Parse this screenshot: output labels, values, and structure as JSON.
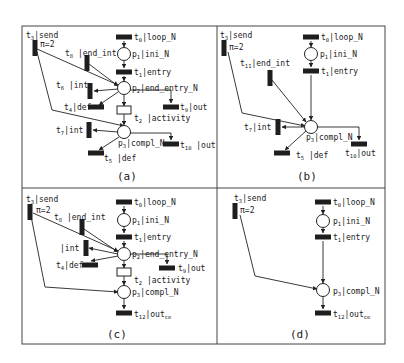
{
  "figure": {
    "frame": {
      "x": 22,
      "y": 26,
      "w": 363,
      "h": 318,
      "vx": 217,
      "hy": 188,
      "color": "#444444"
    },
    "panels": [
      {
        "id": "a",
        "caption": "(a)",
        "caption_pos": [
          117,
          180
        ],
        "places": [
          {
            "id": "p1",
            "x": 124,
            "y": 54,
            "label": "p",
            "sub": "1",
            "rest": "|ini_N",
            "lx": 132,
            "ly": 57
          },
          {
            "id": "p2",
            "x": 124,
            "y": 88,
            "label": "p",
            "sub": "2",
            "rest": "|end_entry_N",
            "lx": 132,
            "ly": 91
          },
          {
            "id": "p3",
            "x": 124,
            "y": 132,
            "label": "p",
            "sub": "3",
            "rest": "|compl_N",
            "lx": 118,
            "ly": 146
          }
        ],
        "transitions": [
          {
            "id": "t0",
            "x": 124,
            "y": 37,
            "orient": "h",
            "label": "t",
            "sub": "0",
            "rest": "|loop_N",
            "lx": 134,
            "ly": 40
          },
          {
            "id": "t1",
            "x": 124,
            "y": 72,
            "orient": "h",
            "label": "t",
            "sub": "1",
            "rest": "|entry",
            "lx": 134,
            "ly": 75
          },
          {
            "id": "t2",
            "x": 124,
            "y": 110,
            "orient": "open",
            "label": "t",
            "sub": "2",
            "rest": " |activity",
            "lx": 134,
            "ly": 121
          },
          {
            "id": "t3",
            "x": 35,
            "y": 48,
            "orient": "v",
            "label": "t",
            "sub": "3",
            "rest": "|send",
            "lx": 26,
            "ly": 38,
            "note": "π=2",
            "nx": 40,
            "ny": 47
          },
          {
            "id": "t8",
            "x": 87,
            "y": 63,
            "orient": "v",
            "label": "t",
            "sub": "8",
            "rest": " |end_int",
            "lx": 65,
            "ly": 56
          },
          {
            "id": "t6",
            "x": 90,
            "y": 91,
            "orient": "v",
            "label": "t",
            "sub": "6",
            "rest": " |int",
            "lx": 56,
            "ly": 88
          },
          {
            "id": "t4",
            "x": 96,
            "y": 107,
            "orient": "h",
            "label": "t",
            "sub": "4",
            "rest": "|def",
            "lx": 64,
            "ly": 110
          },
          {
            "id": "t9",
            "x": 171,
            "y": 107,
            "orient": "h",
            "label": "t",
            "sub": "9",
            "rest": "|out",
            "lx": 180,
            "ly": 110
          },
          {
            "id": "t7",
            "x": 89,
            "y": 130,
            "orient": "v",
            "label": "t",
            "sub": "7",
            "rest": "|int",
            "lx": 56,
            "ly": 133
          },
          {
            "id": "t10",
            "x": 171,
            "y": 144,
            "orient": "h",
            "label": "t",
            "sub": "10",
            "rest": " |out",
            "lx": 180,
            "ly": 148
          },
          {
            "id": "t5",
            "x": 96,
            "y": 153,
            "orient": "h",
            "label": "t",
            "sub": "5",
            "rest": " |def",
            "lx": 104,
            "ly": 161
          }
        ],
        "arcs": [
          "124,41 124,47",
          "124,61 124,68",
          "124,76 124,81",
          "124,95 124,106",
          "124,114 124,125",
          "37,49 118,85",
          "89,64 118,86",
          "118,89 94,91",
          "118,92 99,105",
          "130,90 171,90 171,103",
          "37,52 52,110 124,126",
          "118,132 93,130",
          "130,133 171,133 171,140",
          "119,137 99,150"
        ]
      },
      {
        "id": "b",
        "caption": "(b)",
        "caption_pos": [
          297,
          180
        ],
        "places": [
          {
            "id": "p1",
            "x": 311,
            "y": 54,
            "label": "p",
            "sub": "1",
            "rest": "|ini_N",
            "lx": 320,
            "ly": 57
          },
          {
            "id": "p3",
            "x": 311,
            "y": 127,
            "label": "p",
            "sub": "3",
            "rest": "|compl_N",
            "lx": 306,
            "ly": 140
          }
        ],
        "transitions": [
          {
            "id": "t0",
            "x": 311,
            "y": 37,
            "orient": "h",
            "label": "t",
            "sub": "0",
            "rest": "|loop_N",
            "lx": 321,
            "ly": 40
          },
          {
            "id": "t1",
            "x": 311,
            "y": 71,
            "orient": "h",
            "label": "t",
            "sub": "1",
            "rest": "|entry",
            "lx": 321,
            "ly": 74
          },
          {
            "id": "t3",
            "x": 224,
            "y": 48,
            "orient": "v",
            "label": "t",
            "sub": "3",
            "rest": "|send",
            "lx": 220,
            "ly": 38,
            "note": "π=2",
            "nx": 229,
            "ny": 50
          },
          {
            "id": "t11",
            "x": 270,
            "y": 78,
            "orient": "v",
            "label": "t",
            "sub": "11",
            "rest": "|end_int",
            "lx": 240,
            "ly": 66
          },
          {
            "id": "t7",
            "x": 278,
            "y": 127,
            "orient": "v",
            "label": "t",
            "sub": "7",
            "rest": "|int",
            "lx": 244,
            "ly": 130
          },
          {
            "id": "t10",
            "x": 359,
            "y": 144,
            "orient": "h",
            "label": "t",
            "sub": "10",
            "rest": "|out",
            "lx": 345,
            "ly": 156
          },
          {
            "id": "t5",
            "x": 282,
            "y": 153,
            "orient": "h",
            "label": "t",
            "sub": "5",
            "rest": " |def",
            "lx": 296,
            "ly": 158
          }
        ],
        "arcs": [
          "311,41 311,47",
          "311,61 311,67",
          "311,75 311,120",
          "228,52 242,113 305,126",
          "272,80 306,122",
          "305,127 282,127",
          "317,127 359,127 359,140",
          "306,131 285,150"
        ]
      },
      {
        "id": "c",
        "caption": "(c)",
        "caption_pos": [
          107,
          338
        ],
        "places": [
          {
            "id": "p1",
            "x": 124,
            "y": 220,
            "label": "p",
            "sub": "1",
            "rest": "|ini_N",
            "lx": 132,
            "ly": 223
          },
          {
            "id": "p2",
            "x": 124,
            "y": 254,
            "label": "p",
            "sub": "2",
            "rest": "|end_entry_N",
            "lx": 132,
            "ly": 257
          },
          {
            "id": "p3",
            "x": 124,
            "y": 292,
            "label": "p",
            "sub": "3",
            "rest": "|compl_N",
            "lx": 132,
            "ly": 295
          }
        ],
        "transitions": [
          {
            "id": "t0",
            "x": 124,
            "y": 202,
            "orient": "h",
            "label": "t",
            "sub": "0",
            "rest": "|loop_N",
            "lx": 134,
            "ly": 205
          },
          {
            "id": "t1",
            "x": 124,
            "y": 237,
            "orient": "h",
            "label": "t",
            "sub": "1",
            "rest": "|entry",
            "lx": 134,
            "ly": 240
          },
          {
            "id": "t2",
            "x": 124,
            "y": 272,
            "orient": "open",
            "label": "t",
            "sub": "2",
            "rest": " |activity",
            "lx": 134,
            "ly": 283
          },
          {
            "id": "t3",
            "x": 30,
            "y": 212,
            "orient": "v",
            "label": "t",
            "sub": "3",
            "rest": "|send",
            "lx": 26,
            "ly": 202,
            "note": "π=2",
            "nx": 36,
            "ny": 213
          },
          {
            "id": "t8",
            "x": 82,
            "y": 227,
            "orient": "v",
            "label": "t",
            "sub": "8",
            "rest": " |end_int",
            "lx": 54,
            "ly": 220
          },
          {
            "id": "t_int",
            "x": 86,
            "y": 248,
            "orient": "v",
            "label": "",
            "sub": "",
            "rest": "|int",
            "lx": 60,
            "ly": 251
          },
          {
            "id": "t4",
            "x": 90,
            "y": 265,
            "orient": "h",
            "label": "t",
            "sub": "4",
            "rest": "|def",
            "lx": 56,
            "ly": 268
          },
          {
            "id": "t9",
            "x": 167,
            "y": 268,
            "orient": "h",
            "label": "t",
            "sub": "9",
            "rest": "|out",
            "lx": 178,
            "ly": 271
          },
          {
            "id": "t12",
            "x": 124,
            "y": 313,
            "orient": "h",
            "label": "t",
            "sub": "12",
            "rest": "|out",
            "sub2": "ce",
            "lx": 134,
            "ly": 317
          }
        ],
        "arcs": [
          "124,206 124,213",
          "124,227 124,233",
          "124,241 124,247",
          "124,261 124,268",
          "124,276 124,285",
          "33,213 118,251",
          "84,229 118,252",
          "118,254 89,248",
          "118,256 91,261",
          "130,254 167,254 167,264",
          "31,216 45,287 118,292",
          "124,299 124,309"
        ]
      },
      {
        "id": "d",
        "caption": "(d)",
        "caption_pos": [
          290,
          338
        ],
        "places": [
          {
            "id": "p1",
            "x": 323,
            "y": 221,
            "label": "p",
            "sub": "1",
            "rest": "|ini_N",
            "lx": 333,
            "ly": 224
          },
          {
            "id": "p3",
            "x": 323,
            "y": 290,
            "label": "p",
            "sub": "3",
            "rest": "|compl_N",
            "lx": 333,
            "ly": 294
          }
        ],
        "transitions": [
          {
            "id": "t0",
            "x": 323,
            "y": 202,
            "orient": "h",
            "label": "t",
            "sub": "0",
            "rest": "|loop_N",
            "lx": 333,
            "ly": 205
          },
          {
            "id": "t1",
            "x": 323,
            "y": 237,
            "orient": "h",
            "label": "t",
            "sub": "1",
            "rest": "|entry",
            "lx": 333,
            "ly": 240
          },
          {
            "id": "t3",
            "x": 235,
            "y": 211,
            "orient": "v",
            "label": "t",
            "sub": "3",
            "rest": "|send",
            "lx": 234,
            "ly": 201,
            "note": "π=2",
            "nx": 240,
            "ny": 213
          },
          {
            "id": "t12",
            "x": 323,
            "y": 313,
            "orient": "h",
            "label": "t",
            "sub": "12",
            "rest": "|out",
            "sub2": "ce",
            "lx": 333,
            "ly": 317
          }
        ],
        "arcs": [
          "323,206 323,214",
          "323,228 323,233",
          "323,241 323,283",
          "240,215 255,276 317,289",
          "323,297 323,309"
        ]
      }
    ]
  }
}
